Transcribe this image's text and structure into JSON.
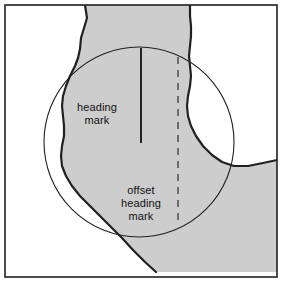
{
  "figure": {
    "name": "river-channel-heading-mark-diagram",
    "width": 282,
    "height": 282,
    "background_color": "#ffffff",
    "border_color": "#231f20",
    "shading": {
      "land_fill": "#cdcdcd",
      "land_stroke": "#231f20",
      "description": "shaded river channel / land mass"
    },
    "radar_circle": {
      "stroke": "#231f20",
      "center_x": 139,
      "center_y": 142,
      "radius": 95
    },
    "heading_mark": {
      "label": "heading\nmark",
      "stroke": "#111111",
      "style": "solid",
      "x": 141,
      "y_top": 48,
      "y_bottom": 143
    },
    "offset_heading_mark": {
      "label": "offset\nheading\nmark",
      "stroke": "#6b6b6b",
      "style": "dashed",
      "x": 178,
      "y_top": 57,
      "y_bottom": 226
    }
  }
}
